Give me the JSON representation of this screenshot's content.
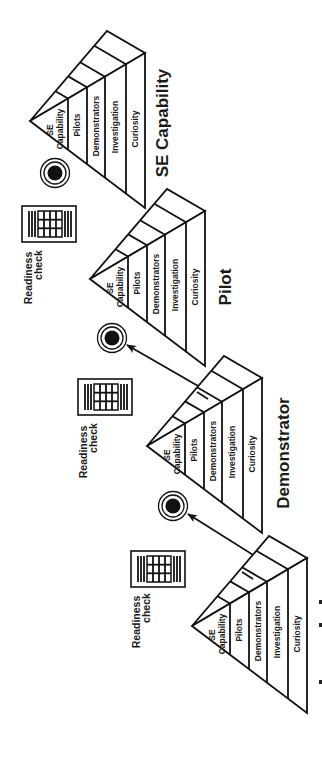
{
  "diagram": {
    "colors": {
      "ink": "#111111",
      "background": "#ffffff"
    },
    "stages": [
      {
        "title": "SE Capability",
        "apex": [
          30,
          121
        ],
        "layers": [
          "SE",
          "Capability",
          "Pilots",
          "Demonstrators",
          "Investigation",
          "Curiosity"
        ],
        "target": {
          "cx": 55,
          "cy": 173
        },
        "tick": false
      },
      {
        "title": "Pilot",
        "apex": [
          90,
          279
        ],
        "layers": [
          "SE",
          "Capability",
          "Pilots",
          "Demonstrators",
          "Investigation",
          "Curiosity"
        ],
        "target": {
          "cx": 112,
          "cy": 338
        },
        "tick": false
      },
      {
        "title": "Demonstrator",
        "apex": [
          147,
          446
        ],
        "layers": [
          "SE",
          "Capability",
          "Pilots",
          "Demonstrators",
          "Investigation",
          "Curiosity"
        ],
        "target": {
          "cx": 173,
          "cy": 506
        },
        "tick": true
      },
      {
        "title": "",
        "apex": [
          192,
          626
        ],
        "layers": [
          "SE",
          "Capability",
          "Pilots",
          "Demonstrators",
          "Investigation",
          "Curiosity"
        ],
        "tick": true
      }
    ],
    "readiness_checks": [
      {
        "line1": "Readiness",
        "line2": "check",
        "icon": "checklist-document-icon"
      },
      {
        "line1": "Readiness",
        "line2": "check",
        "icon": "checklist-document-icon"
      },
      {
        "line1": "Readiness",
        "line2": "check",
        "icon": "checklist-document-icon"
      }
    ],
    "icons": {
      "target": "bullseye-target-icon",
      "arrow": "arrow-icon",
      "document": "checklist-document-icon"
    }
  }
}
